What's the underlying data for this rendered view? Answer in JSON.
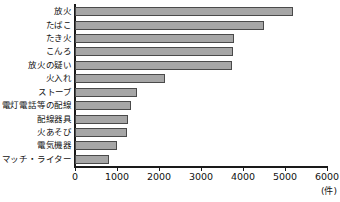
{
  "chart_data": {
    "type": "bar",
    "orientation": "horizontal",
    "title": "",
    "xlabel": "(件)",
    "ylabel": "",
    "xlim": [
      0,
      6000
    ],
    "xticks": [
      0,
      1000,
      2000,
      3000,
      4000,
      5000,
      6000
    ],
    "xtick_labels": [
      "0",
      "1000",
      "2000",
      "3000",
      "4000",
      "5000",
      "6000"
    ],
    "grid": false,
    "legend": false,
    "categories": [
      "放火",
      "たばこ",
      "たき火",
      "こんろ",
      "放火の疑い",
      "火入れ",
      "ストーブ",
      "電灯電話等の配線",
      "配線器具",
      "火あそび",
      "電気機器",
      "マッチ・ライター"
    ],
    "values": [
      5200,
      4490,
      3790,
      3760,
      3730,
      2150,
      1470,
      1330,
      1260,
      1240,
      1010,
      810
    ],
    "bar_color": "#a6a6a6",
    "bar_edge_color": "#4a4a4a",
    "axis_color": "#1a1a1a"
  }
}
